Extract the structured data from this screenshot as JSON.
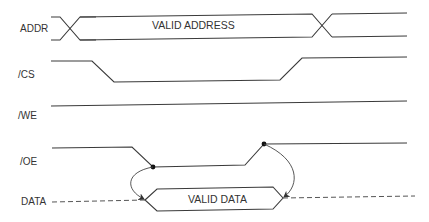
{
  "diagram": {
    "type": "timing-diagram",
    "signals": [
      {
        "name": "ADDR",
        "label": "ADDR",
        "bus_label": "VALID ADDRESS"
      },
      {
        "name": "/CS",
        "label": "/CS"
      },
      {
        "name": "/WE",
        "label": "/WE"
      },
      {
        "name": "/OE",
        "label": "/OE"
      },
      {
        "name": "DATA",
        "label": "DATA",
        "bus_label": "VALID DATA"
      }
    ],
    "annotations": [
      {
        "from": "/OE falling edge",
        "to": "DATA valid start"
      },
      {
        "from": "/OE rising edge",
        "to": "DATA valid end"
      }
    ],
    "colors": {
      "line": "#3a3a3a",
      "background": "#ffffff"
    }
  }
}
